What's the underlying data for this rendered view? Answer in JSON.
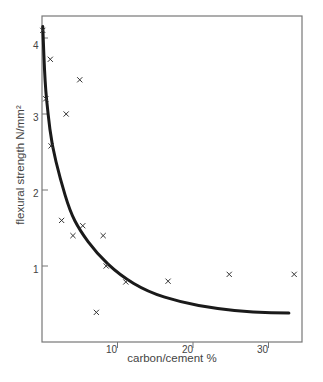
{
  "chart_data": {
    "type": "scatter",
    "title": "",
    "xlabel": "carbon/cement %",
    "ylabel": "flexural strength N/mm²",
    "xlim": [
      0,
      34
    ],
    "ylim": [
      0,
      4.3
    ],
    "grid": false,
    "legend": null,
    "x_ticks": [
      10,
      20,
      30
    ],
    "y_ticks": [
      1,
      2,
      3,
      4
    ],
    "x_tick_labels": [
      "10",
      "20",
      "30"
    ],
    "y_tick_labels": [
      "1",
      "2",
      "3",
      "4"
    ],
    "series": [
      {
        "name": "measurements",
        "marker": "x",
        "points": [
          {
            "x": 0.1,
            "y": 4.1
          },
          {
            "x": 1.1,
            "y": 3.72
          },
          {
            "x": 5.0,
            "y": 3.45
          },
          {
            "x": 0.5,
            "y": 3.2
          },
          {
            "x": 3.2,
            "y": 3.0
          },
          {
            "x": 1.2,
            "y": 2.58
          },
          {
            "x": 2.6,
            "y": 1.6
          },
          {
            "x": 5.4,
            "y": 1.53
          },
          {
            "x": 4.1,
            "y": 1.4
          },
          {
            "x": 8.1,
            "y": 1.4
          },
          {
            "x": 8.5,
            "y": 1.0
          },
          {
            "x": 11.1,
            "y": 0.79
          },
          {
            "x": 7.2,
            "y": 0.39
          },
          {
            "x": 16.7,
            "y": 0.8
          },
          {
            "x": 24.8,
            "y": 0.89
          },
          {
            "x": 33.4,
            "y": 0.89
          }
        ]
      },
      {
        "name": "trend curve",
        "type": "line",
        "points": [
          {
            "x": 0.1,
            "y": 4.15
          },
          {
            "x": 0.4,
            "y": 3.4
          },
          {
            "x": 0.8,
            "y": 3.0
          },
          {
            "x": 1.3,
            "y": 2.6
          },
          {
            "x": 2.4,
            "y": 2.15
          },
          {
            "x": 3.7,
            "y": 1.72
          },
          {
            "x": 5.0,
            "y": 1.47
          },
          {
            "x": 7.2,
            "y": 1.17
          },
          {
            "x": 10.3,
            "y": 0.88
          },
          {
            "x": 14.0,
            "y": 0.66
          },
          {
            "x": 18.5,
            "y": 0.52
          },
          {
            "x": 23.0,
            "y": 0.44
          },
          {
            "x": 28.0,
            "y": 0.39
          },
          {
            "x": 32.7,
            "y": 0.38
          }
        ]
      }
    ]
  },
  "labels": {
    "ylabel": "flexural strength N/mm²",
    "xlabel": "carbon/cement %",
    "yticks": [
      "1",
      "2",
      "3",
      "4"
    ],
    "xticks": [
      "10",
      "20",
      "30"
    ]
  },
  "colors": {
    "axis": "#777777",
    "curve": "#1a1a1a",
    "marker": "#333333"
  }
}
